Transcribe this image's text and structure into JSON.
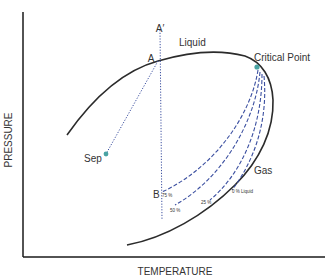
{
  "diagram": {
    "type": "phase-envelope",
    "axes": {
      "x_label": "TEMPERATURE",
      "y_label": "PRESSURE"
    },
    "labels": {
      "a_prime": "A′",
      "a": "A",
      "liquid": "Liquid",
      "critical_point": "Critical Point",
      "sep": "Sep",
      "gas": "Gas",
      "b": "B"
    },
    "quality_lines": [
      {
        "label": "75 %"
      },
      {
        "label": "50 %"
      },
      {
        "label": "25 %"
      },
      {
        "label": "0 % Liquid"
      }
    ],
    "colors": {
      "envelope": "#2b2b2b",
      "dashed_lines": "#3b4fa0",
      "markers": "#4aa3a3",
      "axes": "#1a1a1a"
    }
  }
}
